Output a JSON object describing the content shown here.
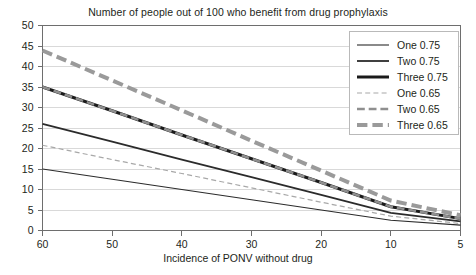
{
  "chart_data": {
    "type": "line",
    "title": "Number of people out of 100 who benefit from drug prophylaxis",
    "xlabel": "Incidence of PONV without drug",
    "ylabel": "",
    "categories": [
      "60",
      "50",
      "40",
      "30",
      "20",
      "10",
      "5"
    ],
    "x_tick_labels": [
      "60",
      "50",
      "40",
      "30",
      "20",
      "10",
      "5"
    ],
    "y_tick_labels": [
      "0",
      "5",
      "10",
      "15",
      "20",
      "25",
      "30",
      "35",
      "40",
      "45",
      "50"
    ],
    "ylim": [
      0,
      50
    ],
    "y_tick_step": 5,
    "grid": "horizontal",
    "legend_position": "top-right",
    "series": [
      {
        "name": "One 0.75",
        "values": [
          15.0,
          12.5,
          10.0,
          7.5,
          5.0,
          2.5,
          1.3
        ],
        "style": "solid",
        "color": "#2b2b2b",
        "width": 1.1
      },
      {
        "name": "Two 0.75",
        "values": [
          26.0,
          21.7,
          17.3,
          13.0,
          8.7,
          4.3,
          2.2
        ],
        "style": "solid",
        "color": "#2b2b2b",
        "width": 1.8
      },
      {
        "name": "Three 0.75",
        "values": [
          35.0,
          29.2,
          23.3,
          17.5,
          11.7,
          5.8,
          2.9
        ],
        "style": "solid",
        "color": "#1a1a1a",
        "width": 3.0
      },
      {
        "name": "One 0.65",
        "values": [
          20.8,
          17.3,
          13.9,
          10.4,
          6.9,
          3.5,
          1.7
        ],
        "style": "dashed",
        "color": "#a8a8a8",
        "width": 1.2
      },
      {
        "name": "Two 0.65",
        "values": [
          35.0,
          29.2,
          23.3,
          17.5,
          11.7,
          5.8,
          2.9
        ],
        "style": "dashed",
        "color": "#8f8f8f",
        "width": 2.6
      },
      {
        "name": "Three 0.65",
        "values": [
          43.9,
          36.6,
          29.3,
          21.9,
          14.6,
          7.3,
          3.7
        ],
        "style": "dashed",
        "color": "#9a9a9a",
        "width": 4.0
      }
    ]
  },
  "legend": {
    "entries": [
      {
        "label": "One 0.75"
      },
      {
        "label": "Two 0.75"
      },
      {
        "label": "Three 0.75"
      },
      {
        "label": "One 0.65"
      },
      {
        "label": "Two 0.65"
      },
      {
        "label": "Three 0.65"
      }
    ]
  },
  "colors": {
    "axis": "#6e6e6e",
    "grid": "#d9d9d9",
    "text": "#231f20",
    "legend_border": "#b9b9b9"
  }
}
